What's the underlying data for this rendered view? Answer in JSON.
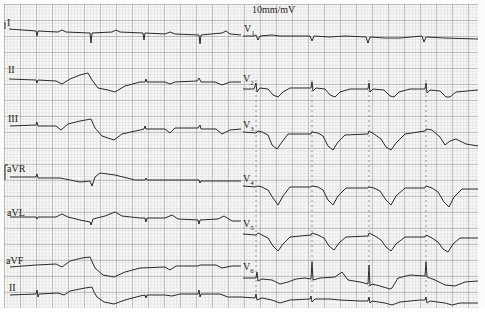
{
  "image": {
    "kind": "12-lead ECG tracing",
    "calibration_label": "10mm/mV",
    "colors": {
      "paper": "#f6f6f4",
      "grid": "#8c8c8c",
      "trace": "#2a2a2a"
    }
  },
  "leads": {
    "left_column": [
      {
        "label": "I",
        "y": 18
      },
      {
        "label": "II",
        "y": 62
      },
      {
        "label": "III",
        "y": 106
      },
      {
        "label": "aVR",
        "y": 158
      },
      {
        "label": "aVL",
        "y": 210
      },
      {
        "label": "aVF",
        "y": 256
      },
      {
        "label": "II",
        "y": 285
      }
    ],
    "right_column": [
      {
        "label": "V",
        "sub": "1",
        "y": 28
      },
      {
        "label": "V",
        "sub": "2",
        "y": 74
      },
      {
        "label": "V",
        "sub": "3",
        "y": 119
      },
      {
        "label": "V",
        "sub": "4",
        "y": 172
      },
      {
        "label": "V",
        "sub": "5",
        "y": 215
      },
      {
        "label": "V",
        "sub": "6",
        "y": 261
      }
    ],
    "rhythm_strip": {
      "label": "II"
    }
  }
}
